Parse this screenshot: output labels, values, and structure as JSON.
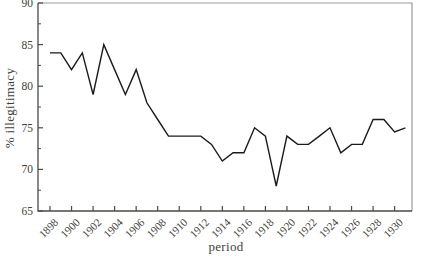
{
  "chart_data": {
    "type": "line",
    "title": "",
    "xlabel": "period",
    "ylabel": "% illegitimacy",
    "x": [
      1898,
      1899,
      1900,
      1901,
      1902,
      1903,
      1904,
      1905,
      1906,
      1907,
      1908,
      1909,
      1910,
      1911,
      1912,
      1913,
      1914,
      1915,
      1916,
      1917,
      1918,
      1919,
      1920,
      1921,
      1922,
      1923,
      1924,
      1925,
      1926,
      1927,
      1928,
      1929,
      1930,
      1931
    ],
    "values": [
      84,
      84,
      82,
      84,
      79,
      85,
      82,
      79,
      82,
      78,
      76,
      74,
      74,
      74,
      74,
      73,
      71,
      72,
      72,
      75,
      74,
      68,
      74,
      73,
      73,
      74,
      75,
      72,
      73,
      73,
      76,
      76,
      74.5,
      75
    ],
    "x_ticks": [
      1898,
      1900,
      1902,
      1904,
      1906,
      1908,
      1910,
      1912,
      1914,
      1916,
      1918,
      1920,
      1922,
      1924,
      1926,
      1928,
      1930
    ],
    "y_ticks": [
      65,
      70,
      75,
      80,
      85,
      90
    ],
    "y_minor_ticks": [
      67.5,
      72.5,
      77.5,
      82.5,
      87.5
    ],
    "ylim": [
      65,
      90
    ],
    "xlim": [
      1896.9,
      1931.7
    ],
    "grid": "off",
    "legend": "none",
    "frame": "box",
    "tick_direction": "in"
  },
  "colors": {
    "background": "#ffffff",
    "text": "#3f3f3a",
    "axis": "#4a4a46",
    "frame_light": "#9b9b97",
    "line": "#1b1b1b"
  }
}
